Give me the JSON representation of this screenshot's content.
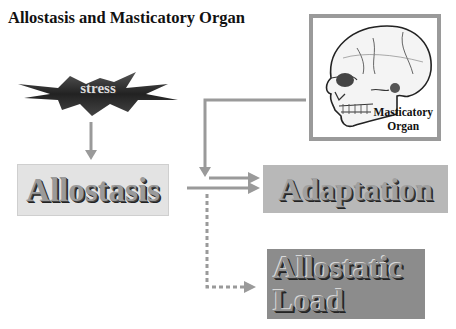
{
  "title": "Allostasis and Masticatory Organ",
  "nodes": {
    "stress": {
      "label": "stress",
      "shape": "starburst",
      "color": "#3a3a3a"
    },
    "allostasis": {
      "label": "Allostasis",
      "color": "#e3e3e3"
    },
    "adaptation": {
      "label": "Adaptation",
      "color": "#b8b8b8"
    },
    "allostatic_load": {
      "line1": "Allostatic",
      "line2": "Load",
      "color": "#8c8c8c"
    },
    "masticatory_organ": {
      "line1": "Masticatory",
      "line2": "Organ",
      "image": "skull-icon",
      "border_color": "#9a9a9a"
    }
  },
  "edges": [
    {
      "from": "stress",
      "to": "allostasis",
      "style": "solid"
    },
    {
      "from": "allostasis",
      "to": "adaptation",
      "style": "solid"
    },
    {
      "from": "masticatory_organ",
      "to": "adaptation",
      "style": "solid"
    },
    {
      "from": "allostasis",
      "to": "allostatic_load",
      "style": "dotted"
    }
  ],
  "colors": {
    "arrow": "#9a9a9a"
  }
}
